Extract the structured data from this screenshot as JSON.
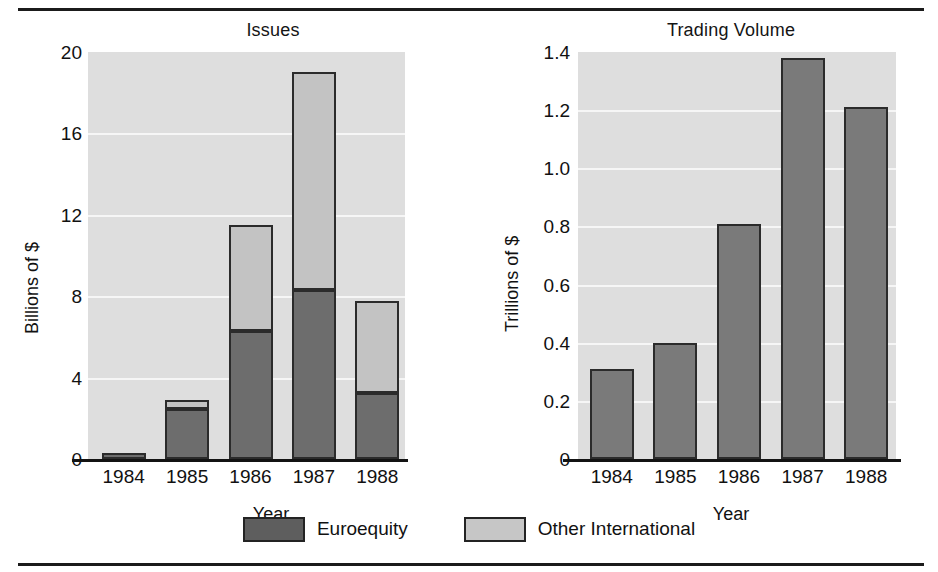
{
  "figure": {
    "background": "#ffffff",
    "bar_dark_color": "#6d6d6d",
    "bar_light_color": "#c3c3c3",
    "plot_background": "#dedede",
    "outline_color": "#2b2b2b"
  },
  "legend": {
    "items": [
      {
        "label": "Euroequity",
        "swatch": "dark",
        "color": "#5e5e5e"
      },
      {
        "label": "Other International",
        "swatch": "light",
        "color": "#c6c6c6"
      }
    ]
  },
  "chart_data": [
    {
      "type": "bar",
      "stacked": true,
      "title": "Issues",
      "xlabel": "Year",
      "ylabel": "Billions of $",
      "categories": [
        "1984",
        "1985",
        "1986",
        "1987",
        "1988"
      ],
      "yticks": [
        "20",
        "16",
        "12",
        "8",
        "4",
        "0"
      ],
      "ytick_values": [
        20,
        16,
        12,
        8,
        4,
        0
      ],
      "ylim": [
        0,
        20
      ],
      "grid": true,
      "legend_position": "bottom-shared",
      "series": [
        {
          "name": "Euroequity",
          "values": [
            0.3,
            2.45,
            6.3,
            8.3,
            3.25
          ]
        },
        {
          "name": "Other International",
          "values": [
            0.0,
            0.45,
            5.2,
            10.7,
            4.5
          ]
        }
      ],
      "totals": [
        0.3,
        2.9,
        11.5,
        19.0,
        7.75
      ]
    },
    {
      "type": "bar",
      "stacked": false,
      "title": "Trading Volume",
      "xlabel": "Year",
      "ylabel": "Trillions of $",
      "categories": [
        "1984",
        "1985",
        "1986",
        "1987",
        "1988"
      ],
      "yticks": [
        "1.4",
        "1.2",
        "1.0",
        "0.8",
        "0.6",
        "0.4",
        "0.2",
        "0"
      ],
      "ytick_values": [
        1.4,
        1.2,
        1.0,
        0.8,
        0.6,
        0.4,
        0.2,
        0
      ],
      "ylim": [
        0,
        1.4
      ],
      "grid": true,
      "legend_position": "none",
      "series": [
        {
          "name": "Trading Volume",
          "values": [
            0.31,
            0.4,
            0.81,
            1.38,
            1.21
          ]
        }
      ]
    }
  ]
}
